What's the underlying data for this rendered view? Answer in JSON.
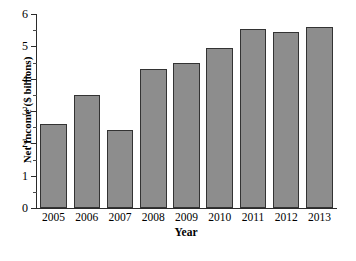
{
  "chart_data": {
    "type": "bar",
    "title": "",
    "xlabel": "Year",
    "ylabel": "Net Income ($ billions)",
    "categories": [
      "2005",
      "2006",
      "2007",
      "2008",
      "2009",
      "2010",
      "2011",
      "2012",
      "2013"
    ],
    "values": [
      2.6,
      3.5,
      2.4,
      4.3,
      4.5,
      4.95,
      5.55,
      5.45,
      5.6
    ],
    "ylim": [
      0,
      6
    ],
    "ytick_labels": [
      "0",
      "1",
      "2",
      "3",
      "4",
      "5",
      "6"
    ],
    "ytick_values": [
      0,
      1,
      2,
      3,
      4,
      5,
      6
    ],
    "yminor_values": [
      0.5,
      1.5,
      2.5,
      3.5,
      4.5,
      5.5
    ],
    "grid": false,
    "legend": false,
    "bar_color": "#8d8d8d",
    "bar_border_color": "#333333",
    "axis_color": "#2b2b2b",
    "background_color": "#ffffff"
  }
}
